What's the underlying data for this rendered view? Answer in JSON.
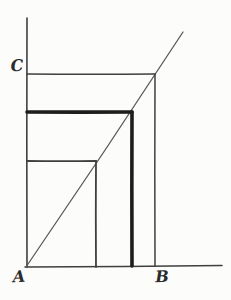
{
  "figure": {
    "background": "#fcfcfa",
    "ink": "#3f3f3f",
    "bold_ink": "#1d1d1d",
    "light_ink": "#5a5a5a",
    "labels": {
      "a": {
        "text": "A",
        "x": 19,
        "y": 277
      },
      "b": {
        "text": "B",
        "x": 162,
        "y": 277
      },
      "c": {
        "text": "C",
        "x": 17,
        "y": 66
      }
    },
    "lines": [
      {
        "name": "y-axis",
        "x1": 27,
        "y1": 18,
        "x2": 27,
        "y2": 267,
        "w": 1.6,
        "color": "#3f3f3f",
        "bow": 0.4
      },
      {
        "name": "x-axis",
        "x1": 25,
        "y1": 267,
        "x2": 222,
        "y2": 265.5,
        "w": 1.6,
        "color": "#3f3f3f",
        "bow": 0.5
      },
      {
        "name": "diagonal-line",
        "x1": 26,
        "y1": 267,
        "x2": 183,
        "y2": 32,
        "w": 1.3,
        "color": "#5a5a5a",
        "bow": 1.6
      },
      {
        "name": "c-horizontal-line",
        "x1": 27,
        "y1": 74,
        "x2": 155,
        "y2": 74,
        "w": 1.5,
        "color": "#3f3f3f",
        "bow": 0.4
      },
      {
        "name": "b-vertical-line",
        "x1": 155,
        "y1": 74,
        "x2": 155,
        "y2": 266,
        "w": 1.5,
        "color": "#3f3f3f",
        "bow": 0.4
      },
      {
        "name": "bold-horizontal-line",
        "x1": 27,
        "y1": 112,
        "x2": 132,
        "y2": 112,
        "w": 3.6,
        "color": "#1d1d1d",
        "bow": 0.3
      },
      {
        "name": "bold-vertical-line",
        "x1": 132,
        "y1": 112,
        "x2": 132,
        "y2": 266,
        "w": 3.6,
        "color": "#1d1d1d",
        "bow": 0.3
      },
      {
        "name": "inner-horizontal-line",
        "x1": 27,
        "y1": 161,
        "x2": 96,
        "y2": 161,
        "w": 1.8,
        "color": "#3f3f3f",
        "bow": 0.4
      },
      {
        "name": "inner-vertical-line",
        "x1": 96,
        "y1": 161,
        "x2": 96,
        "y2": 267,
        "w": 1.8,
        "color": "#3f3f3f",
        "bow": 0.4
      }
    ]
  }
}
